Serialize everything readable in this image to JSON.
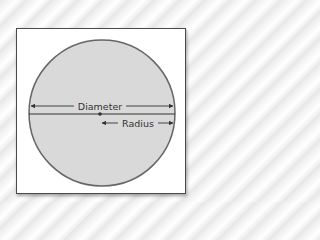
{
  "diagram": {
    "labels": {
      "diameter": "Diameter",
      "radius": "Radius"
    },
    "colors": {
      "circle_fill": "#d9d9d9",
      "circle_stroke": "#666666",
      "line": "#333333",
      "frame_border": "#4a4a4a"
    }
  }
}
